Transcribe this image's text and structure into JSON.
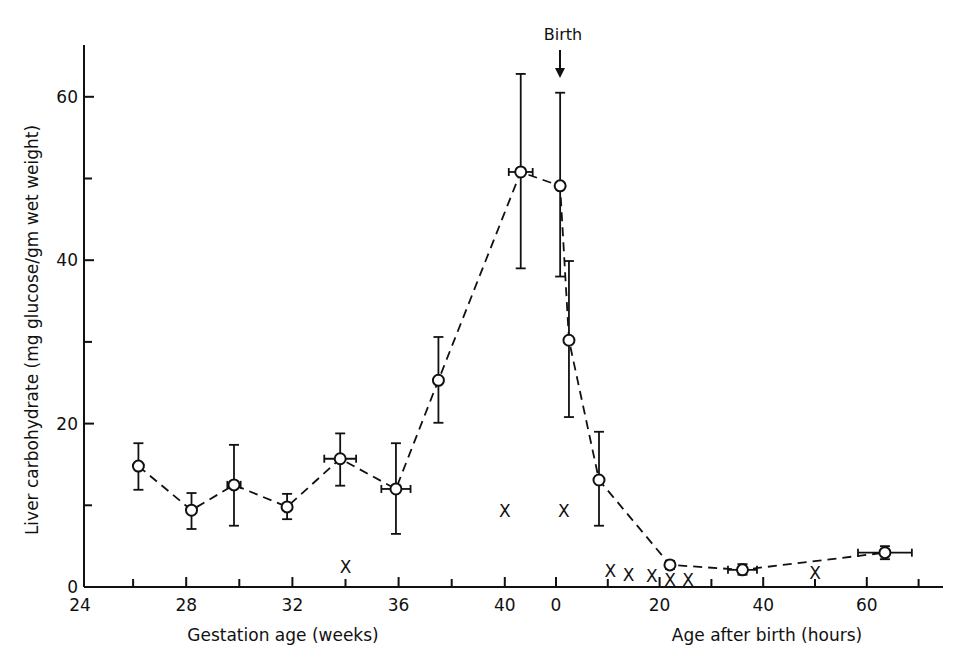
{
  "chart_data": {
    "type": "scatter",
    "title": "",
    "annotation": {
      "text": "Birth",
      "points_to": "hours 0"
    },
    "ylabel": "Liver carbohydrate (mg glucose/gm wet weight)",
    "ylim": [
      0,
      65
    ],
    "yticks": [
      0,
      20,
      40,
      60
    ],
    "yminor_ticks": [
      10,
      30,
      50
    ],
    "grid": false,
    "legend": null,
    "x_axes": [
      {
        "name": "gestation",
        "label": "Gestation age (weeks)",
        "range": [
          24,
          40.9
        ],
        "ticks": [
          24,
          28,
          32,
          36,
          40
        ],
        "minor_ticks": [
          26,
          30,
          34,
          38
        ]
      },
      {
        "name": "postnatal",
        "label": "Age after birth (hours)",
        "range": [
          0,
          75
        ],
        "ticks": [
          0,
          20,
          40,
          60
        ],
        "minor_ticks": [
          10,
          30,
          50,
          70
        ]
      }
    ],
    "series": [
      {
        "name": "Mean liver carbohydrate (open circles, dashed line)",
        "marker": "circle",
        "line": "dashed",
        "points": [
          {
            "axis": "gestation",
            "x": 26.2,
            "y": 14.8,
            "ylo": 11.9,
            "yhi": 17.6,
            "xerr": 0
          },
          {
            "axis": "gestation",
            "x": 28.2,
            "y": 9.4,
            "ylo": 7.1,
            "yhi": 11.5,
            "xerr": 0
          },
          {
            "axis": "gestation",
            "x": 29.8,
            "y": 12.5,
            "ylo": 7.5,
            "yhi": 17.4,
            "xerr": 0.25
          },
          {
            "axis": "gestation",
            "x": 31.8,
            "y": 9.8,
            "ylo": 8.3,
            "yhi": 11.4,
            "xerr": 0
          },
          {
            "axis": "gestation",
            "x": 33.8,
            "y": 15.7,
            "ylo": 12.4,
            "yhi": 18.8,
            "xerr": 0.6
          },
          {
            "axis": "gestation",
            "x": 35.9,
            "y": 12.0,
            "ylo": 6.5,
            "yhi": 17.6,
            "xerr": 0.55
          },
          {
            "axis": "gestation",
            "x": 37.5,
            "y": 25.3,
            "ylo": 20.1,
            "yhi": 30.6,
            "xerr": 0
          },
          {
            "axis": "gestation",
            "x": 40.6,
            "y": 50.8,
            "ylo": 39.0,
            "yhi": 62.8,
            "xerr": 0.45
          },
          {
            "axis": "postnatal",
            "x": 0.8,
            "y": 49.1,
            "ylo": 38.0,
            "yhi": 60.5,
            "xerr": 0
          },
          {
            "axis": "postnatal",
            "x": 2.5,
            "y": 30.2,
            "ylo": 20.8,
            "yhi": 39.9,
            "xerr": 0
          },
          {
            "axis": "postnatal",
            "x": 8.3,
            "y": 13.1,
            "ylo": 7.5,
            "yhi": 19.0,
            "xerr": 0
          },
          {
            "axis": "postnatal",
            "x": 22,
            "y": 2.7,
            "ylo": 2.2,
            "yhi": 3.2,
            "xerr": 0
          },
          {
            "axis": "postnatal",
            "x": 36,
            "y": 2.1,
            "ylo": 1.5,
            "yhi": 2.8,
            "xerr": 2.8
          },
          {
            "axis": "postnatal",
            "x": 63.5,
            "y": 4.2,
            "ylo": 3.4,
            "yhi": 5.0,
            "xerr": 5.2
          }
        ]
      },
      {
        "name": "Individual values (X)",
        "marker": "x",
        "line": "none",
        "points": [
          {
            "axis": "gestation",
            "x": 34,
            "y": 2.5
          },
          {
            "axis": "gestation",
            "x": 40,
            "y": 9.3
          },
          {
            "axis": "postnatal",
            "x": 1.5,
            "y": 9.3
          },
          {
            "axis": "postnatal",
            "x": 10.5,
            "y": 2.0
          },
          {
            "axis": "postnatal",
            "x": 14,
            "y": 1.5
          },
          {
            "axis": "postnatal",
            "x": 18.5,
            "y": 1.3
          },
          {
            "axis": "postnatal",
            "x": 22,
            "y": 0.8
          },
          {
            "axis": "postnatal",
            "x": 25.5,
            "y": 0.8
          },
          {
            "axis": "postnatal",
            "x": 50,
            "y": 1.7
          }
        ]
      }
    ]
  },
  "labels": {
    "y_axis_title": "Liver carbohydrate (mg glucose/gm wet weight)",
    "x_axis_left_title": "Gestation age (weeks)",
    "x_axis_right_title": "Age after birth (hours)",
    "birth_annotation": "Birth",
    "x_marker_glyph": "X"
  }
}
